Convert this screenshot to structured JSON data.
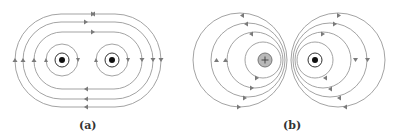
{
  "figure": {
    "panels": [
      {
        "id": "a",
        "label": "(a)",
        "description": "Magnetic field lines of two parallel wires with currents in the same direction (both out of page)"
      },
      {
        "id": "b",
        "label": "(b)",
        "description": "Magnetic field lines of two parallel wires with currents in opposite directions (left into page, right out of page)"
      }
    ],
    "colors": {
      "line": "#8a8a8a",
      "arrow": "#7a7a7a",
      "conductor_fill_into": "#b8b8b8",
      "dot": "#111111"
    },
    "symbols": {
      "into_page": "+",
      "out_of_page": "•"
    }
  }
}
